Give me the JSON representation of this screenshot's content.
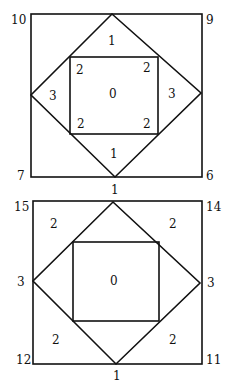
{
  "figures": [
    {
      "name": "top-figure",
      "corner_labels": {
        "top_left": "10",
        "top_right": "9",
        "bottom_left": "7",
        "bottom_right": "6",
        "bottom_mid": "1"
      },
      "region_labels": {
        "top": "1",
        "left": "3",
        "right": "3",
        "bottom": "1",
        "center": "0",
        "inner_tl": "2",
        "inner_tr": "2",
        "inner_bl": "2",
        "inner_br": "2"
      }
    },
    {
      "name": "bottom-figure",
      "corner_labels": {
        "top_left": "15",
        "top_right": "14",
        "bottom_left": "12",
        "bottom_right": "11",
        "bottom_mid": "1",
        "left_mid": "3",
        "right_mid": "3"
      },
      "region_labels": {
        "center": "0",
        "corner_tl": "2",
        "corner_tr": "2",
        "corner_bl": "2",
        "corner_br": "2"
      }
    }
  ]
}
